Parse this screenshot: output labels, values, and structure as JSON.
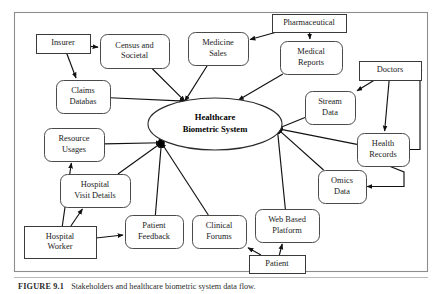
{
  "figure": {
    "caption_label": "FIGURE 9.1",
    "caption_text": "Stakeholders and healthcare biometric system data flow.",
    "frame": {
      "x": 14,
      "y": 12,
      "width": 414,
      "height": 260
    }
  },
  "center": {
    "name": "healthcare-biometric-system",
    "line1": "Healthcare",
    "line2": "Biometric System",
    "cx": 215,
    "cy": 124,
    "rx": 67,
    "ry": 26
  },
  "nodes": [
    {
      "id": "insurer",
      "label_lines": [
        "Insurer"
      ],
      "x": 36,
      "y": 34,
      "w": 54,
      "h": 19,
      "shape": "rect"
    },
    {
      "id": "census_societal",
      "label_lines": [
        "Census and",
        "Societal"
      ],
      "x": 100,
      "y": 34,
      "w": 69,
      "h": 34,
      "shape": "rounded"
    },
    {
      "id": "medicine_sales",
      "label_lines": [
        "Medicine",
        "Sales"
      ],
      "x": 188,
      "y": 32,
      "w": 60,
      "h": 33,
      "shape": "rounded"
    },
    {
      "id": "pharmaceutical",
      "label_lines": [
        "Pharmaceutical"
      ],
      "x": 272,
      "y": 14,
      "w": 74,
      "h": 18,
      "shape": "rect"
    },
    {
      "id": "medical_reports",
      "label_lines": [
        "Medical",
        "Reports"
      ],
      "x": 280,
      "y": 41,
      "w": 62,
      "h": 33,
      "shape": "rounded"
    },
    {
      "id": "doctors",
      "label_lines": [
        "Doctors"
      ],
      "x": 359,
      "y": 61,
      "w": 62,
      "h": 19,
      "shape": "rect"
    },
    {
      "id": "claims_database",
      "label_lines": [
        "Claims",
        "Databas"
      ],
      "x": 56,
      "y": 80,
      "w": 54,
      "h": 33,
      "shape": "rounded"
    },
    {
      "id": "stream_data",
      "label_lines": [
        "Stream",
        "Data"
      ],
      "x": 305,
      "y": 91,
      "w": 50,
      "h": 33,
      "shape": "rounded"
    },
    {
      "id": "health_records",
      "label_lines": [
        "Health",
        "Records"
      ],
      "x": 357,
      "y": 133,
      "w": 52,
      "h": 33,
      "shape": "rounded"
    },
    {
      "id": "resource_usages",
      "label_lines": [
        "Resource",
        "Usages"
      ],
      "x": 44,
      "y": 128,
      "w": 60,
      "h": 33,
      "shape": "rounded"
    },
    {
      "id": "omics_data",
      "label_lines": [
        "Omics",
        "Data"
      ],
      "x": 318,
      "y": 170,
      "w": 48,
      "h": 33,
      "shape": "rounded"
    },
    {
      "id": "hospital_visit",
      "label_lines": [
        "Hospital",
        "Visit Details"
      ],
      "x": 60,
      "y": 174,
      "w": 70,
      "h": 33,
      "shape": "rounded"
    },
    {
      "id": "patient_feedback",
      "label_lines": [
        "Patient",
        "Feedback"
      ],
      "x": 125,
      "y": 215,
      "w": 58,
      "h": 33,
      "shape": "rounded"
    },
    {
      "id": "clinical_forums",
      "label_lines": [
        "Clinical",
        "Forums"
      ],
      "x": 192,
      "y": 215,
      "w": 54,
      "h": 33,
      "shape": "rounded"
    },
    {
      "id": "web_platform",
      "label_lines": [
        "Web Based",
        "Platform"
      ],
      "x": 255,
      "y": 209,
      "w": 64,
      "h": 33,
      "shape": "rounded"
    },
    {
      "id": "hospital_worker",
      "label_lines": [
        "Hospital",
        "Worker"
      ],
      "x": 24,
      "y": 226,
      "w": 72,
      "h": 32,
      "shape": "rect"
    },
    {
      "id": "patient",
      "label_lines": [
        "Patient"
      ],
      "x": 249,
      "y": 255,
      "w": 56,
      "h": 18,
      "shape": "rect"
    }
  ],
  "edges": [
    {
      "from": "insurer",
      "to": "census_societal",
      "label": ""
    },
    {
      "from": "insurer",
      "to": "claims_database",
      "label": ""
    },
    {
      "from": "census_societal",
      "to": "center",
      "label": ""
    },
    {
      "from": "claims_database",
      "to": "center",
      "label": ""
    },
    {
      "from": "pharmaceutical",
      "to": "medicine_sales",
      "label": ""
    },
    {
      "from": "pharmaceutical",
      "to": "medical_reports",
      "label": ""
    },
    {
      "from": "medicine_sales",
      "to": "center",
      "label": ""
    },
    {
      "from": "medical_reports",
      "to": "center",
      "label": ""
    },
    {
      "from": "doctors",
      "to": "stream_data",
      "label": ""
    },
    {
      "from": "doctors",
      "to": "health_records",
      "label": ""
    },
    {
      "from": "stream_data",
      "to": "center",
      "label": ""
    },
    {
      "from": "health_records",
      "to": "center",
      "label": ""
    },
    {
      "from": "health_records",
      "to": "doctors",
      "label": ""
    },
    {
      "from": "omics_data",
      "to": "center",
      "label": ""
    },
    {
      "from": "health_records",
      "to": "omics_data",
      "label": ""
    },
    {
      "from": "resource_usages",
      "to": "center",
      "label": ""
    },
    {
      "from": "hospital_visit",
      "to": "center",
      "label": ""
    },
    {
      "from": "patient_feedback",
      "to": "center",
      "label": ""
    },
    {
      "from": "clinical_forums",
      "to": "center",
      "label": ""
    },
    {
      "from": "web_platform",
      "to": "center",
      "label": ""
    },
    {
      "from": "hospital_worker",
      "to": "resource_usages",
      "label": ""
    },
    {
      "from": "hospital_worker",
      "to": "hospital_visit",
      "label": ""
    },
    {
      "from": "hospital_worker",
      "to": "patient_feedback",
      "label": ""
    },
    {
      "from": "patient",
      "to": "clinical_forums",
      "label": ""
    },
    {
      "from": "patient",
      "to": "web_platform",
      "label": ""
    }
  ],
  "colors": {
    "frame_stroke": "#8d8d8d",
    "node_stroke": "#4a4a4a",
    "edge_stroke": "#111111",
    "text": "#1a1a1a",
    "background": "#ffffff"
  }
}
